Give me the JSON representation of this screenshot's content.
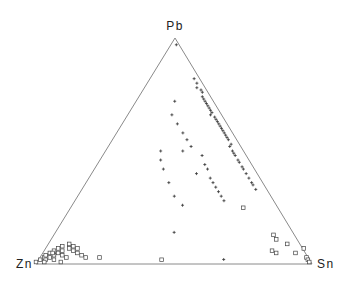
{
  "chart_data": {
    "type": "scatter",
    "subtype": "ternary",
    "title": "",
    "vertices": {
      "top": "Pb",
      "left": "Zn",
      "right": "Sn"
    },
    "components": [
      "Pb",
      "Zn",
      "Sn"
    ],
    "grid": false,
    "legend": "none",
    "series": [
      {
        "name": "group-plus",
        "marker": "plus",
        "points_pb_sn": [
          [
            0.97,
            0.02
          ],
          [
            0.82,
            0.16
          ],
          [
            0.8,
            0.18
          ],
          [
            0.78,
            0.19
          ],
          [
            0.77,
            0.21
          ],
          [
            0.76,
            0.22
          ],
          [
            0.74,
            0.23
          ],
          [
            0.73,
            0.24
          ],
          [
            0.72,
            0.25
          ],
          [
            0.71,
            0.26
          ],
          [
            0.7,
            0.27
          ],
          [
            0.69,
            0.28
          ],
          [
            0.68,
            0.29
          ],
          [
            0.67,
            0.3
          ],
          [
            0.66,
            0.3
          ],
          [
            0.65,
            0.32
          ],
          [
            0.64,
            0.33
          ],
          [
            0.63,
            0.34
          ],
          [
            0.62,
            0.35
          ],
          [
            0.61,
            0.36
          ],
          [
            0.6,
            0.37
          ],
          [
            0.59,
            0.38
          ],
          [
            0.58,
            0.39
          ],
          [
            0.57,
            0.4
          ],
          [
            0.56,
            0.41
          ],
          [
            0.55,
            0.42
          ],
          [
            0.53,
            0.44
          ],
          [
            0.52,
            0.44
          ],
          [
            0.5,
            0.46
          ],
          [
            0.49,
            0.47
          ],
          [
            0.48,
            0.48
          ],
          [
            0.46,
            0.5
          ],
          [
            0.45,
            0.51
          ],
          [
            0.43,
            0.53
          ],
          [
            0.42,
            0.54
          ],
          [
            0.4,
            0.56
          ],
          [
            0.38,
            0.58
          ],
          [
            0.36,
            0.6
          ],
          [
            0.35,
            0.61
          ],
          [
            0.33,
            0.63
          ],
          [
            0.72,
            0.14
          ],
          [
            0.66,
            0.16
          ],
          [
            0.62,
            0.2
          ],
          [
            0.58,
            0.24
          ],
          [
            0.55,
            0.27
          ],
          [
            0.52,
            0.3
          ],
          [
            0.5,
            0.28
          ],
          [
            0.48,
            0.36
          ],
          [
            0.44,
            0.39
          ],
          [
            0.42,
            0.41
          ],
          [
            0.4,
            0.38
          ],
          [
            0.38,
            0.44
          ],
          [
            0.36,
            0.46
          ],
          [
            0.34,
            0.48
          ],
          [
            0.32,
            0.5
          ],
          [
            0.3,
            0.52
          ],
          [
            0.28,
            0.54
          ],
          [
            0.5,
            0.2
          ],
          [
            0.46,
            0.22
          ],
          [
            0.42,
            0.25
          ],
          [
            0.36,
            0.3
          ],
          [
            0.3,
            0.35
          ],
          [
            0.26,
            0.4
          ],
          [
            0.14,
            0.43
          ],
          [
            0.02,
            0.67
          ]
        ]
      },
      {
        "name": "group-square",
        "marker": "square",
        "points_pb_sn": [
          [
            0.0,
            0.0
          ],
          [
            0.01,
            0.01
          ],
          [
            0.02,
            0.02
          ],
          [
            0.01,
            0.03
          ],
          [
            0.03,
            0.02
          ],
          [
            0.02,
            0.04
          ],
          [
            0.04,
            0.03
          ],
          [
            0.03,
            0.05
          ],
          [
            0.05,
            0.04
          ],
          [
            0.04,
            0.06
          ],
          [
            0.06,
            0.05
          ],
          [
            0.05,
            0.07
          ],
          [
            0.07,
            0.06
          ],
          [
            0.03,
            0.08
          ],
          [
            0.06,
            0.09
          ],
          [
            0.08,
            0.08
          ],
          [
            0.02,
            0.1
          ],
          [
            0.05,
            0.11
          ],
          [
            0.04,
            0.13
          ],
          [
            0.06,
            0.12
          ],
          [
            0.03,
            0.15
          ],
          [
            0.02,
            0.17
          ],
          [
            0.04,
            0.04
          ],
          [
            0.01,
            0.06
          ],
          [
            0.0,
            0.03
          ],
          [
            0.0,
            0.09
          ],
          [
            0.07,
            0.1
          ],
          [
            0.02,
            0.22
          ],
          [
            0.01,
            0.45
          ],
          [
            0.24,
            0.63
          ],
          [
            0.1,
            0.82
          ],
          [
            0.05,
            0.83
          ],
          [
            0.04,
            0.85
          ],
          [
            0.08,
            0.87
          ],
          [
            0.04,
            0.92
          ],
          [
            0.06,
            0.94
          ],
          [
            0.02,
            0.97
          ],
          [
            0.01,
            0.98
          ],
          [
            0.0,
            0.99
          ],
          [
            0.12,
            0.8
          ]
        ]
      }
    ]
  }
}
